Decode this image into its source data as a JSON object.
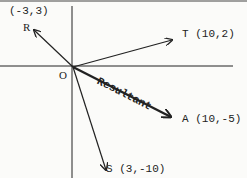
{
  "diagram": {
    "origin": {
      "label": "O"
    },
    "vectors": [
      {
        "name": "R",
        "coords": "(-3,3)",
        "x": -3,
        "y": 3
      },
      {
        "name": "T",
        "coords": "(10,2)",
        "x": 10,
        "y": 2
      },
      {
        "name": "S",
        "coords": "(3,-10)",
        "x": 3,
        "y": -10
      },
      {
        "name": "A",
        "coords": "(10,-5)",
        "x": 10,
        "y": -5,
        "note": "Resultant"
      }
    ],
    "resultant_label": "Resultant",
    "colors": {
      "ink": "#222222",
      "background": "#fbfbf9"
    }
  }
}
